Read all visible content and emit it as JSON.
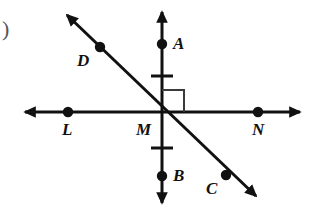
{
  "figure": {
    "kind": "geometry-diagram",
    "colors": {
      "stroke": "#111111",
      "right_angle_stroke": "#3a3a3a",
      "background": "#ffffff",
      "marker_fill": "#111111"
    },
    "stroke_width": 3,
    "marker_radius": 5.2,
    "question_marker": {
      "glyph": ")",
      "x": 2,
      "y": 18
    },
    "lines": [
      {
        "name": "line-ln-horizontal",
        "x1": 25,
        "y1": 112,
        "x2": 300,
        "y2": 112,
        "arrow_start": true,
        "arrow_end": true
      },
      {
        "name": "line-ab-vertical",
        "x1": 162,
        "y1": 12,
        "x2": 162,
        "y2": 203,
        "arrow_start": true,
        "arrow_end": true
      },
      {
        "name": "line-dc-diagonal",
        "x1": 67,
        "y1": 15,
        "x2": 256,
        "y2": 196,
        "arrow_start": true,
        "arrow_end": true
      }
    ],
    "right_angle": {
      "name": "right-angle-marker",
      "x": 162,
      "y": 112,
      "size": 22,
      "quadrant": "upper-right"
    },
    "tick_marks": [
      {
        "name": "tick-above-m",
        "cx": 162,
        "cy": 76,
        "half_width": 11
      },
      {
        "name": "tick-below-m",
        "cx": 162,
        "cy": 148,
        "half_width": 11
      }
    ],
    "points": [
      {
        "id": "A",
        "label": "A",
        "dot": true,
        "cx": 162,
        "cy": 44,
        "label_x": 173,
        "label_y": 35
      },
      {
        "id": "B",
        "label": "B",
        "dot": true,
        "cx": 162,
        "cy": 176,
        "label_x": 173,
        "label_y": 167
      },
      {
        "id": "L",
        "label": "L",
        "dot": true,
        "cx": 68,
        "cy": 112,
        "label_x": 62,
        "label_y": 121
      },
      {
        "id": "M",
        "label": "M",
        "dot": false,
        "cx": 162,
        "cy": 112,
        "label_x": 136,
        "label_y": 121
      },
      {
        "id": "N",
        "label": "N",
        "dot": true,
        "cx": 258,
        "cy": 112,
        "label_x": 252,
        "label_y": 121
      },
      {
        "id": "D",
        "label": "D",
        "dot": true,
        "cx": 100,
        "cy": 47,
        "label_x": 77,
        "label_y": 52
      },
      {
        "id": "C",
        "label": "C",
        "dot": true,
        "cx": 226,
        "cy": 175,
        "label_x": 206,
        "label_y": 180
      }
    ]
  }
}
